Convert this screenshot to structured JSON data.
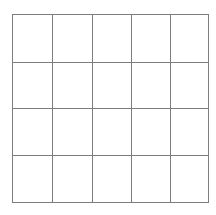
{
  "figure": {
    "name": "grid-diagram",
    "title": "",
    "background_color": "#ffffff"
  },
  "grid": {
    "columns": 5,
    "rows": 4,
    "total_cells": 20,
    "line_color": "#7d7d7d",
    "line_width_px": 1,
    "cell_fill": "#ffffff",
    "bounds": {
      "left_px": 12,
      "top_px": 14,
      "right_px": 203,
      "bottom_px": 202,
      "width_px": 191,
      "height_px": 188
    },
    "vertical_line_x": [
      12,
      51,
      90,
      128,
      166,
      203
    ],
    "horizontal_line_y": [
      14,
      62,
      108,
      155,
      202
    ],
    "cell_width_px": 38,
    "cell_height_px": 47,
    "cells": [
      [
        "",
        "",
        "",
        "",
        ""
      ],
      [
        "",
        "",
        "",
        "",
        ""
      ],
      [
        "",
        "",
        "",
        "",
        ""
      ],
      [
        "",
        "",
        "",
        "",
        ""
      ]
    ]
  }
}
